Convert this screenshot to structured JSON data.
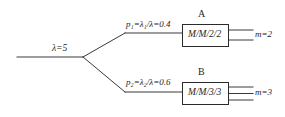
{
  "diagram": {
    "stroke_color": "#3a3a3a",
    "text_color": "#262626",
    "background": "#ffffff",
    "input": {
      "symbol": "λ",
      "equals": "=",
      "value": "5",
      "full_text": "λ=5"
    },
    "branches": [
      {
        "id": "branch-upper",
        "prob_symbol": "p",
        "prob_subscript": "1",
        "rate_symbol": "λ",
        "rate_subscript": "1",
        "denominator": "λ",
        "value": "0.4",
        "full_text": "p₁=λ₁/λ=0.4"
      },
      {
        "id": "branch-lower",
        "prob_symbol": "p",
        "prob_subscript": "2",
        "rate_symbol": "λ",
        "rate_subscript": "2",
        "denominator": "λ",
        "value": "0.6",
        "full_text": "p₂=λ₂/λ=0.6"
      }
    ],
    "nodes": [
      {
        "id": "node-a",
        "label": "A",
        "kendall": "M/M/2/2",
        "servers_symbol": "m",
        "servers_value": "2",
        "servers_text": "m=2",
        "server_line_count": 2
      },
      {
        "id": "node-b",
        "label": "B",
        "kendall": "M/M/3/3",
        "servers_symbol": "m",
        "servers_value": "3",
        "servers_text": "m=3",
        "server_line_count": 3
      }
    ]
  }
}
